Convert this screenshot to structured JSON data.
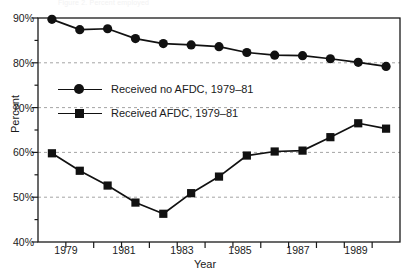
{
  "figure": {
    "top_note": "Figure 2. Percent employed",
    "xlabel": "Year",
    "ylabel": "Percent"
  },
  "legend": [
    {
      "label": "Received no AFDC, 1979–81",
      "marker": "circle-marker-icon"
    },
    {
      "label": "Received AFDC, 1979–81",
      "marker": "square-marker-icon"
    }
  ],
  "axis": {
    "y_ticks": [
      "90%",
      "80%",
      "70%",
      "60%",
      "50%",
      "40%"
    ],
    "x_ticks": [
      "1979",
      "1981",
      "1983",
      "1985",
      "1987",
      "1989"
    ]
  },
  "chart_data": {
    "type": "line",
    "title": "",
    "xlabel": "Year",
    "ylabel": "Percent",
    "xlim": [
      1978.5,
      1991.5
    ],
    "ylim": [
      40,
      90
    ],
    "grid": true,
    "legend_position": "inside-upper-left",
    "x": [
      1979,
      1980,
      1981,
      1982,
      1983,
      1984,
      1985,
      1986,
      1987,
      1988,
      1989,
      1990,
      1991
    ],
    "xtick_labels": [
      "1979",
      "1981",
      "1983",
      "1985",
      "1987",
      "1989"
    ],
    "ytick_labels": [
      "40%",
      "50%",
      "60%",
      "70%",
      "80%",
      "90%"
    ],
    "series": [
      {
        "name": "Received no AFDC, 1979–81",
        "marker": "circle",
        "values": [
          89.7,
          87.4,
          87.6,
          85.4,
          84.3,
          84.0,
          83.6,
          82.3,
          81.7,
          81.6,
          80.9,
          80.1,
          79.2
        ]
      },
      {
        "name": "Received AFDC, 1979–81",
        "marker": "square",
        "values": [
          59.8,
          55.9,
          52.6,
          48.8,
          46.3,
          50.9,
          54.6,
          59.3,
          60.2,
          60.4,
          63.4,
          66.5,
          65.3
        ]
      }
    ]
  }
}
